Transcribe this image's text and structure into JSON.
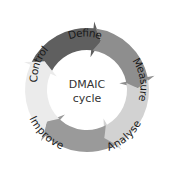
{
  "diagram": {
    "type": "cycle",
    "center": {
      "line1": "DMAIC",
      "line2": "cycle"
    },
    "segments": [
      {
        "label": "Define",
        "color": "#5f5f5f"
      },
      {
        "label": "Measure",
        "color": "#8e8e8e"
      },
      {
        "label": "Analyse",
        "color": "#d2d2d2"
      },
      {
        "label": "Improve",
        "color": "#9a9a9a"
      },
      {
        "label": "Control",
        "color": "#ebebeb"
      }
    ]
  }
}
